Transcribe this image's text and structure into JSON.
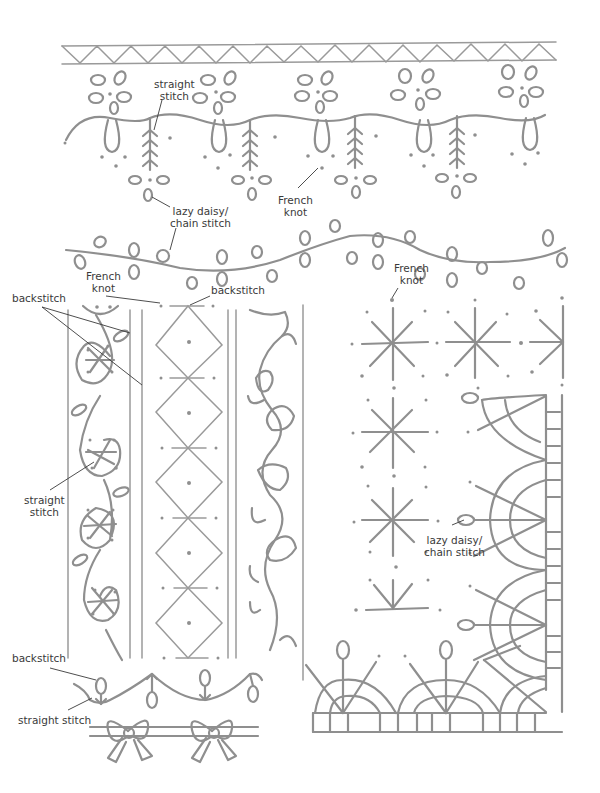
{
  "diagram": {
    "type": "embroidery-stitch-pattern-sheet",
    "line_color": "#8f8f8f",
    "label_color": "#3a3a3a",
    "patterns": [
      {
        "name": "zigzag-border",
        "description": "zigzag between two rules"
      },
      {
        "name": "scallop-flower-border",
        "description": "scallop loops with lazy daisy flowers, fern straight stitches and French knots"
      },
      {
        "name": "leafy-vine",
        "description": "wavy backstitch vine with lazy daisy leaves"
      },
      {
        "name": "swirl-column",
        "description": "swirling vine column with star straight stitches"
      },
      {
        "name": "diamond-column",
        "description": "stacked diamonds with French knot centers"
      },
      {
        "name": "heart-vine-column",
        "description": "vine with heart-shaped leaves"
      },
      {
        "name": "star-grid-corner",
        "description": "grid of star stitches with fan corner border"
      },
      {
        "name": "tulip-wave",
        "description": "wave with alternating buds"
      },
      {
        "name": "bow-border",
        "description": "bows on double line"
      }
    ]
  },
  "labels": {
    "straight_stitch_top": {
      "line1": "straight",
      "line2": "stitch"
    },
    "lazy_daisy_top": {
      "line1": "lazy daisy/",
      "line2": "chain stitch"
    },
    "french_knot_top": {
      "line1": "French",
      "line2": "knot"
    },
    "french_knot_left": {
      "line1": "French",
      "line2": "knot"
    },
    "backstitch_left": "backstitch",
    "backstitch_mid": "backstitch",
    "french_knot_right": {
      "line1": "French",
      "line2": "knot"
    },
    "straight_stitch_left": {
      "line1": "straight",
      "line2": "stitch"
    },
    "lazy_daisy_right": {
      "line1": "lazy daisy/",
      "line2": "chain stitch"
    },
    "backstitch_bottom": "backstitch",
    "straight_stitch_bottom": "straight stitch"
  }
}
